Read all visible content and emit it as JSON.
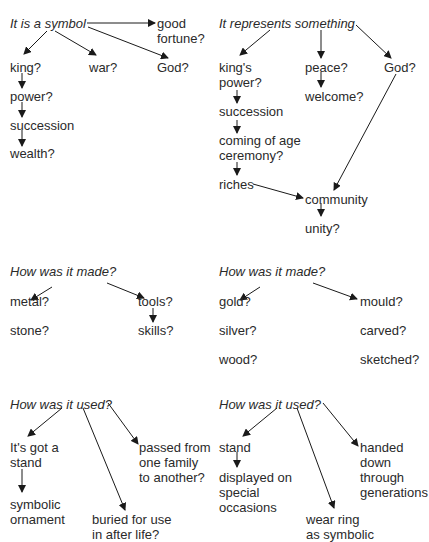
{
  "panels": {
    "symbol": {
      "heading": "It is a symbol",
      "nodes": [
        "good",
        "fortune?",
        "king?",
        "war?",
        "God?",
        "power?",
        "succession",
        "wealth?"
      ]
    },
    "represents": {
      "heading": "It represents something",
      "nodes": [
        "king's",
        "power?",
        "peace?",
        "God?",
        "welcome?",
        "succession",
        "coming of age",
        "ceremony?",
        "riches",
        "community",
        "unity?"
      ]
    },
    "made_left": {
      "heading": "How was it made?",
      "nodes": [
        "metal?",
        "tools?",
        "stone?",
        "skills?"
      ]
    },
    "made_right": {
      "heading": "How was it made?",
      "nodes": [
        "gold?",
        "mould?",
        "silver?",
        "carved?",
        "wood?",
        "sketched?"
      ]
    },
    "used_left": {
      "heading": "How was it used?",
      "nodes": [
        "It's got a",
        "stand",
        "passed from",
        "one family",
        "to another?",
        "symbolic",
        "ornament",
        "buried for use",
        "in after life?"
      ]
    },
    "used_right": {
      "heading": "How was it used?",
      "nodes": [
        "stand",
        "handed",
        "down",
        "through",
        "generations",
        "displayed on",
        "special",
        "occasions",
        "wear ring",
        "as symbolic"
      ]
    }
  }
}
